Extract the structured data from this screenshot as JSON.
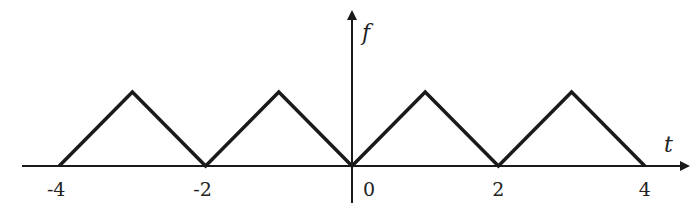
{
  "diagram": {
    "type": "periodic-triangle-wave",
    "x_axis_label": "t",
    "y_axis_label": "f",
    "x_ticks": [
      {
        "value": -4,
        "label": "-4"
      },
      {
        "value": -2,
        "label": "-2"
      },
      {
        "value": 0,
        "label": "0"
      },
      {
        "value": 2,
        "label": "2"
      },
      {
        "value": 4,
        "label": "4"
      }
    ],
    "x_range": [
      -4.4,
      4.5
    ],
    "wave_points": [
      {
        "t": -4,
        "f": 0
      },
      {
        "t": -3,
        "f": 1
      },
      {
        "t": -2,
        "f": 0
      },
      {
        "t": -1,
        "f": 1
      },
      {
        "t": 0,
        "f": 0
      },
      {
        "t": 1,
        "f": 1
      },
      {
        "t": 2,
        "f": 0
      },
      {
        "t": 3,
        "f": 1
      },
      {
        "t": 4,
        "f": 0
      }
    ],
    "line_color": "#1a1a1a"
  }
}
